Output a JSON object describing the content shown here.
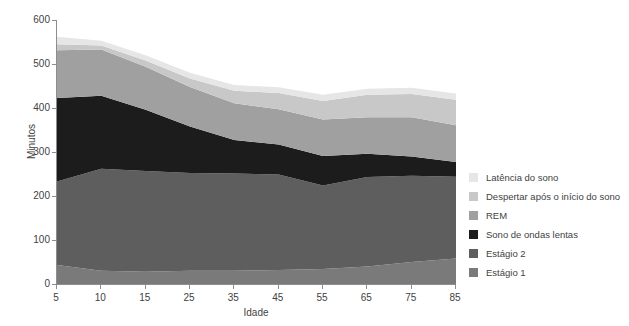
{
  "chart_data": {
    "type": "area",
    "stacked": true,
    "title": "",
    "xlabel": "Idade",
    "ylabel": "Minutos",
    "categories": [
      "5",
      "10",
      "15",
      "25",
      "35",
      "45",
      "55",
      "65",
      "75",
      "85"
    ],
    "x": [
      5,
      10,
      15,
      25,
      35,
      45,
      55,
      65,
      75,
      85
    ],
    "xlim": [
      5,
      85
    ],
    "ylim": [
      0,
      600
    ],
    "yticks": [
      0,
      100,
      200,
      300,
      400,
      500,
      600
    ],
    "grid": false,
    "legend_position": "right",
    "series": [
      {
        "name": "Estágio 1",
        "color": "#7a7a7a",
        "values": [
          43,
          30,
          28,
          30,
          30,
          32,
          34,
          40,
          50,
          58
        ]
      },
      {
        "name": "Estágio 2",
        "color": "#5e5e5e",
        "values": [
          190,
          232,
          229,
          222,
          221,
          217,
          190,
          203,
          196,
          186
        ]
      },
      {
        "name": "Sono de ondas lentas",
        "color": "#1c1c1c",
        "values": [
          190,
          166,
          139,
          106,
          76,
          68,
          67,
          53,
          44,
          33
        ]
      },
      {
        "name": "REM",
        "color": "#a0a0a0",
        "values": [
          108,
          105,
          98,
          90,
          84,
          80,
          83,
          83,
          89,
          84
        ]
      },
      {
        "name": "Despertar após o início do sono",
        "color": "#c8c8c8",
        "values": [
          14,
          9,
          14,
          19,
          28,
          37,
          42,
          51,
          53,
          58
        ]
      },
      {
        "name": "Latência do sono",
        "color": "#e6e6e6",
        "values": [
          17,
          11,
          12,
          13,
          13,
          13,
          14,
          14,
          14,
          14
        ]
      }
    ],
    "stack_order_bottom_to_top": [
      "Estágio 1",
      "Estágio 2",
      "Sono de ondas lentas",
      "REM",
      "Despertar após o início do sono",
      "Latência do sono"
    ]
  },
  "axes": {
    "y_title": "Minutos",
    "x_title": "Idade",
    "y_tick_labels": [
      "600",
      "500",
      "400",
      "300",
      "200",
      "100",
      "0"
    ],
    "x_tick_labels": [
      "5",
      "10",
      "15",
      "25",
      "35",
      "45",
      "55",
      "65",
      "75",
      "85"
    ]
  },
  "legend": {
    "items": [
      {
        "label": "Latência do sono",
        "color": "#e6e6e6"
      },
      {
        "label": "Despertar após o início do sono",
        "color": "#c8c8c8"
      },
      {
        "label": "REM",
        "color": "#a0a0a0"
      },
      {
        "label": "Sono de ondas lentas",
        "color": "#1c1c1c"
      },
      {
        "label": "Estágio 2",
        "color": "#5e5e5e"
      },
      {
        "label": "Estágio 1",
        "color": "#7a7a7a"
      }
    ]
  }
}
